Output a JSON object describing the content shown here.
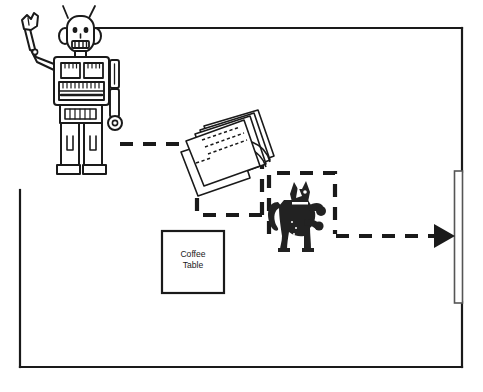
{
  "scene": {
    "title": "Robot, papers, cat and coffee table floor-plan sketch",
    "background_color": "#ffffff",
    "line_color": "#1a1a1a",
    "fill_color": "#222222",
    "width": 483,
    "height": 392
  },
  "room": {
    "name": "room-outline",
    "wall_color": "#1a1a1a",
    "wall_thickness": 2,
    "top_wall_y": 28,
    "bottom_wall_y": 367,
    "left_wall_x": 20,
    "left_wall_top_y": 190,
    "right_wall_x": 462,
    "top_wall_start_x": 72
  },
  "door": {
    "name": "door",
    "x": 455,
    "y": 170,
    "width": 8,
    "height": 134
  },
  "objects": {
    "robot": {
      "label": "robot",
      "x": 16,
      "y": 4,
      "width": 110,
      "height": 170,
      "style": "line-art outline"
    },
    "papers": {
      "label": "papers",
      "x": 178,
      "y": 104,
      "width": 96,
      "height": 80,
      "style": "stack of tilted sheets with dashed text lines"
    },
    "cat": {
      "label": "cat",
      "x": 268,
      "y": 180,
      "width": 58,
      "height": 72,
      "style": "black silhouette, raised paw"
    },
    "coffee_table": {
      "label_line1": "Coffee",
      "label_line2": "Table",
      "x": 162,
      "y": 231,
      "width": 62,
      "height": 62,
      "border_color": "#1a1a1a"
    }
  },
  "annotations": {
    "dashed_path": {
      "name": "motion-path",
      "dash_color": "#1a1a1a",
      "dash_pattern": "11 9",
      "stroke_width": 4,
      "description": "dashed trajectory from robot, past papers, around cat, exiting through door"
    },
    "dashed_region_left": {
      "name": "dashed-region-papers",
      "x": 196,
      "y": 152,
      "width": 66,
      "height": 63
    },
    "dashed_region_right": {
      "name": "dashed-region-cat",
      "x": 268,
      "y": 172,
      "width": 67,
      "height": 62
    },
    "arrow_head": {
      "name": "arrow-head",
      "tip_x": 452,
      "tip_y": 235,
      "direction": "right"
    }
  }
}
